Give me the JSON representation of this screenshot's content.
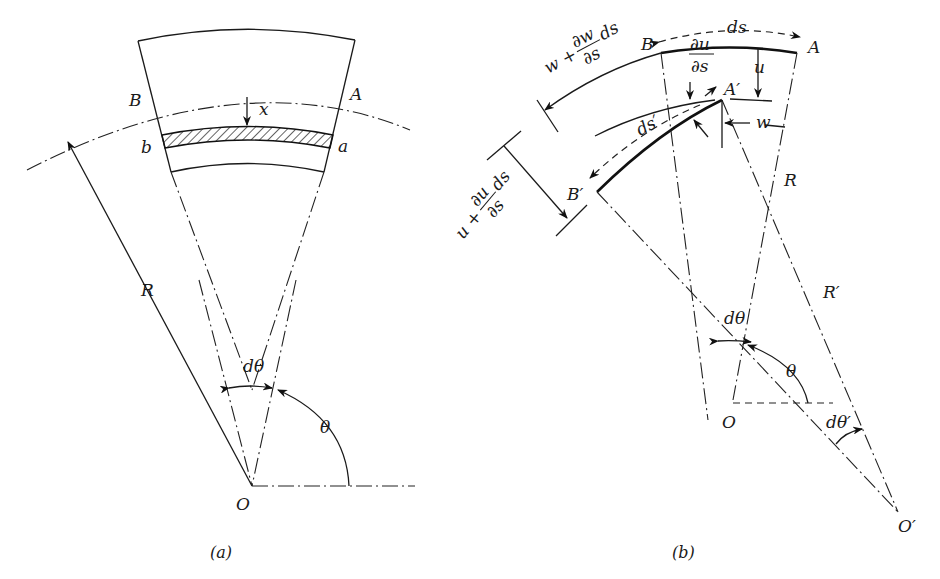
{
  "figure": {
    "panels": [
      {
        "id": "a",
        "caption": "(a)",
        "labels": {
          "B": "B",
          "A": "A",
          "x": "x",
          "b": "b",
          "a": "a",
          "R": "R",
          "dtheta": "dθ",
          "theta": "θ",
          "O": "O"
        }
      },
      {
        "id": "b",
        "caption": "(b)",
        "labels": {
          "B": "B",
          "A": "A",
          "ds": "ds",
          "w_plus": "w + ",
          "dw": "∂w",
          "ds_den_w": "∂s",
          "ds_tail_w": "ds",
          "du_num": "∂u",
          "du_den": "∂s",
          "u": "u",
          "A_prime": "A′",
          "w": "w",
          "ds_prime": "ds′",
          "B_prime": "B′",
          "u_plus": "u + ",
          "du2": "∂u",
          "ds_den_u": "∂s",
          "ds_tail_u": "ds",
          "R": "R",
          "R_prime": "R′",
          "dtheta": "dθ",
          "theta": "θ",
          "O": "O",
          "dtheta_prime": "dθ′",
          "O_prime": "O′"
        }
      }
    ]
  }
}
